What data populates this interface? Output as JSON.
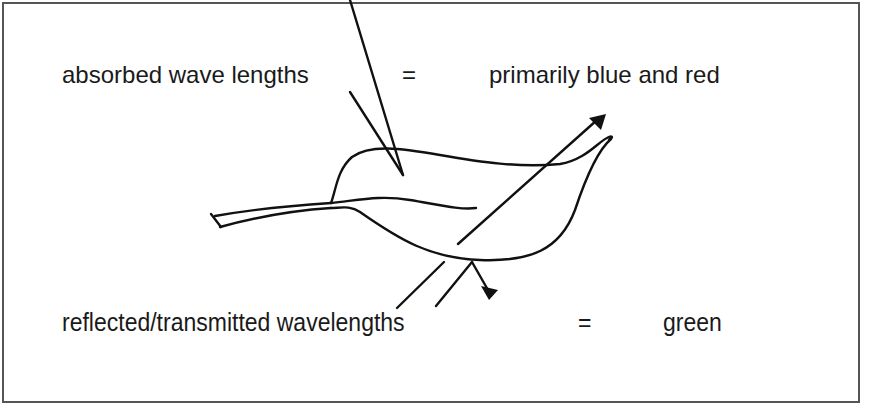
{
  "diagram": {
    "absorbed": {
      "label": "absorbed wave lengths",
      "equals": "=",
      "value": "primarily blue and red"
    },
    "reflected": {
      "label": "reflected/transmitted wavelengths",
      "equals": "=",
      "value": "green"
    },
    "illustration": "leaf-icon",
    "colors": {
      "stroke": "#111111",
      "frame": "#555555",
      "background": "#ffffff"
    }
  }
}
